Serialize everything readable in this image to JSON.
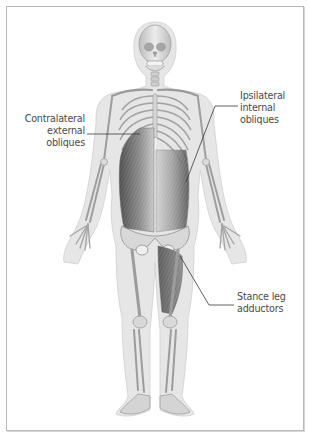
{
  "figure": {
    "colors": {
      "frame_border": "#b9b9b9",
      "body_outline_fill": "#e4e4e4",
      "bone_fill": "#d2d2d2",
      "bone_stroke": "#9a9a9a",
      "muscle_dark": "#5a5a5a",
      "muscle_mid": "#8a8a8a",
      "label_text": "#4a4a4a",
      "leader_line": "#3a3a3a"
    }
  },
  "labels": {
    "contralateral": {
      "lines": [
        "Contralateral",
        "external",
        "obliques"
      ]
    },
    "ipsilateral": {
      "lines": [
        "Ipsilateral",
        "internal",
        "obliques"
      ]
    },
    "stance": {
      "lines": [
        "Stance leg",
        "adductors"
      ]
    }
  }
}
